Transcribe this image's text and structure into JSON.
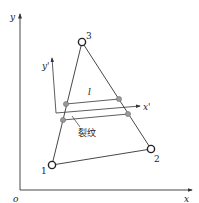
{
  "figure": {
    "axes": {
      "origin_label": "o",
      "x_label": "x",
      "y_label": "y"
    },
    "local_axes": {
      "x_label": "x'",
      "y_label": "y'"
    },
    "nodes": [
      {
        "id": "1",
        "label": "1"
      },
      {
        "id": "2",
        "label": "2"
      },
      {
        "id": "3",
        "label": "3"
      }
    ],
    "crack": {
      "length_label": "l",
      "label": "裂纹"
    },
    "colors": {
      "line": "#333333",
      "crack_point": "#888888"
    }
  }
}
